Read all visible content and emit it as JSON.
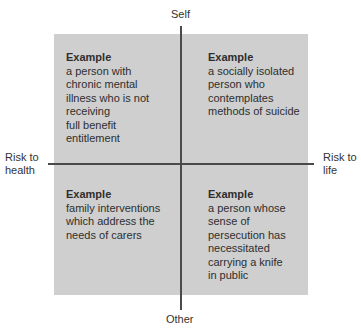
{
  "axes": {
    "top": "Self",
    "bottom": "Other",
    "left": "Risk to\nhealth",
    "right": "Risk to\nlife"
  },
  "quadrants": {
    "top_left": {
      "title": "Example",
      "text": "a person with\nchronic mental\nillness who is not\nreceiving\nfull benefit\nentitlement"
    },
    "top_right": {
      "title": "Example",
      "text": "a socially isolated\nperson who\ncontemplates\nmethods of suicide"
    },
    "bottom_left": {
      "title": "Example",
      "text": "family interventions\nwhich address the\nneeds of carers"
    },
    "bottom_right": {
      "title": "Example",
      "text": "a person whose\nsense of\npersecution has\nnecessitated\ncarrying a knife\nin public"
    }
  },
  "colors": {
    "box_fill": "#cfcfcf",
    "axis_line": "#4a4a4a"
  }
}
